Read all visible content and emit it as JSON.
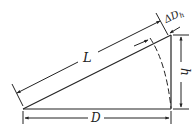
{
  "diagram": {
    "type": "slope-distance geometry",
    "colors": {
      "line": "#222222",
      "background": "#ffffff"
    },
    "labels": {
      "slope_length": "L",
      "horizontal_distance": "D",
      "height": "h",
      "delta_prefix": "ΔD",
      "delta_subscript": "h"
    },
    "vertices": {
      "origin": [
        23,
        109
      ],
      "right_base": [
        171,
        109
      ],
      "top": [
        171,
        35
      ]
    }
  }
}
